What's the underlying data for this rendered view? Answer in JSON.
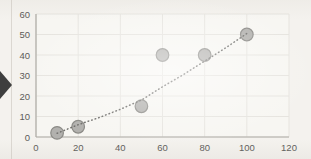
{
  "page": {
    "background_color": "#f4f2ee",
    "left_rule_color": "#dbd7d1"
  },
  "arrow": {
    "color": "#3e3e3e"
  },
  "chart_data": {
    "type": "scatter",
    "title": "",
    "xlabel": "",
    "ylabel": "",
    "legend": "none",
    "grid": true,
    "xlim": [
      0,
      120
    ],
    "ylim": [
      0,
      60
    ],
    "x_ticks": [
      0,
      20,
      40,
      60,
      80,
      100,
      120
    ],
    "y_ticks": [
      0,
      10,
      20,
      30,
      40,
      50,
      60
    ],
    "points": [
      {
        "x": 10,
        "y": 2
      },
      {
        "x": 20,
        "y": 5
      },
      {
        "x": 50,
        "y": 15
      },
      {
        "x": 60,
        "y": 40
      },
      {
        "x": 80,
        "y": 40
      },
      {
        "x": 100,
        "y": 50
      }
    ],
    "trendline": {
      "style": "dotted",
      "path_points": [
        {
          "x": 10,
          "y": 1.8
        },
        {
          "x": 20,
          "y": 6
        },
        {
          "x": 30,
          "y": 9.5
        },
        {
          "x": 40,
          "y": 13.5
        },
        {
          "x": 50,
          "y": 18
        },
        {
          "x": 60,
          "y": 24.5
        },
        {
          "x": 70,
          "y": 30.5
        },
        {
          "x": 80,
          "y": 37
        },
        {
          "x": 90,
          "y": 43.5
        },
        {
          "x": 100,
          "y": 50.5
        }
      ]
    },
    "marker": {
      "fill": "#b2b1ae",
      "stroke": "#8b8a86",
      "radius_px": 6.3
    },
    "colors": {
      "plot_background": "#f7f6f2",
      "gridline": "#e6e4df",
      "axis": "#aeaba5",
      "tick_label": "#5d5c59",
      "trendline": "#6f6e6b"
    }
  }
}
